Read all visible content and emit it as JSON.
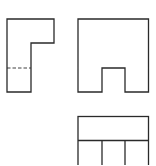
{
  "diagram": {
    "type": "orthographic-projection",
    "views": [
      {
        "name": "side-view",
        "outline": "7,19 54,19 54,43 31,43 31,92 7,92",
        "hidden_lines": [
          {
            "x1": 7,
            "y1": 68,
            "x2": 31,
            "y2": 68
          }
        ]
      },
      {
        "name": "front-view",
        "outline": "78,19 148.5,19 148.5,92 125,92 125,68 102,68 102,92 78,92"
      },
      {
        "name": "top-view",
        "outline": {
          "x": 78,
          "y": 116.5,
          "w": 70.5,
          "h": 50
        },
        "lines": [
          {
            "x1": 78,
            "y1": 140.5,
            "x2": 148.5,
            "y2": 140.5
          },
          {
            "x1": 102,
            "y1": 140.5,
            "x2": 102,
            "y2": 166
          },
          {
            "x1": 125,
            "y1": 140.5,
            "x2": 125,
            "y2": 166
          }
        ]
      }
    ],
    "colors": {
      "line": "#2a2a2a",
      "background": "#ffffff"
    }
  }
}
